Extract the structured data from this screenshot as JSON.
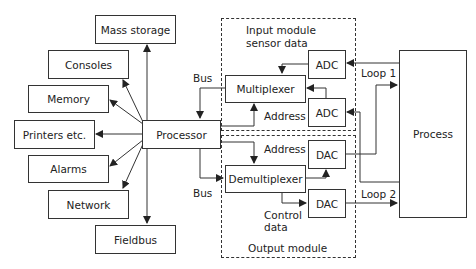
{
  "diagram": {
    "peripherals": [
      {
        "label": "Mass storage"
      },
      {
        "label": "Consoles"
      },
      {
        "label": "Memory"
      },
      {
        "label": "Printers etc."
      },
      {
        "label": "Alarms"
      },
      {
        "label": "Network"
      },
      {
        "label": "Fieldbus"
      }
    ],
    "processor": {
      "label": "Processor"
    },
    "input_module": {
      "title_line1": "Input module",
      "title_line2": "sensor data",
      "multiplexer": "Multiplexer",
      "adc1": "ADC",
      "adc2": "ADC",
      "address_label": "Address"
    },
    "output_module": {
      "title": "Output module",
      "demultiplexer": "Demultiplexer",
      "dac1": "DAC",
      "dac2": "DAC",
      "address_label": "Address",
      "control_line1": "Control",
      "control_line2": "data"
    },
    "bus_top": "Bus",
    "bus_bottom": "Bus",
    "process": {
      "label": "Process"
    },
    "loop1": "Loop 1",
    "loop2": "Loop 2"
  }
}
